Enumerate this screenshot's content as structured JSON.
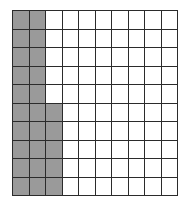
{
  "figure": {
    "name": "shaded-grid-fraction-model",
    "colors": {
      "shaded": "#9a9a9a",
      "unshaded": "#ffffff",
      "gridline": "#2b2b2b",
      "background": "#ffffff"
    }
  },
  "chart_data": {
    "type": "heatmap",
    "title": "",
    "subtitle": "",
    "xlabel": "",
    "ylabel": "",
    "rows": 10,
    "cols": 10,
    "categories": [
      "1",
      "2",
      "3",
      "4",
      "5",
      "6",
      "7",
      "8",
      "9",
      "10"
    ],
    "tick_labels_visible": false,
    "grid": true,
    "legend": null,
    "annotations": [],
    "value_map": {
      "0": "unshaded",
      "1": "shaded"
    },
    "total_cells": 100,
    "shaded_count": 25,
    "unshaded_count": 75,
    "shaded_fraction": "25/100",
    "values": [
      [
        1,
        1,
        0,
        0,
        0,
        0,
        0,
        0,
        0,
        0
      ],
      [
        1,
        1,
        0,
        0,
        0,
        0,
        0,
        0,
        0,
        0
      ],
      [
        1,
        1,
        0,
        0,
        0,
        0,
        0,
        0,
        0,
        0
      ],
      [
        1,
        1,
        0,
        0,
        0,
        0,
        0,
        0,
        0,
        0
      ],
      [
        1,
        1,
        0,
        0,
        0,
        0,
        0,
        0,
        0,
        0
      ],
      [
        1,
        1,
        1,
        0,
        0,
        0,
        0,
        0,
        0,
        0
      ],
      [
        1,
        1,
        1,
        0,
        0,
        0,
        0,
        0,
        0,
        0
      ],
      [
        1,
        1,
        1,
        0,
        0,
        0,
        0,
        0,
        0,
        0
      ],
      [
        1,
        1,
        1,
        0,
        0,
        0,
        0,
        0,
        0,
        0
      ],
      [
        1,
        1,
        1,
        0,
        0,
        0,
        0,
        0,
        0,
        0
      ]
    ]
  }
}
